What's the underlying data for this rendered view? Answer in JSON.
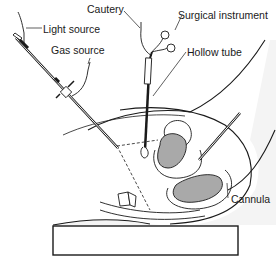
{
  "diagram": {
    "labels": {
      "cautery": "Cautery",
      "surgical_instrument": "Surgical instrument",
      "light_source": "Light source",
      "hollow_tube": "Hollow tube",
      "gas_source": "Gas source",
      "cannula": "Cannula"
    },
    "colors": {
      "line": "#1a1a1a",
      "organ_fill": "#a9a9a9",
      "skin_fill": "#f4f4f4",
      "background": "#ffffff"
    }
  }
}
